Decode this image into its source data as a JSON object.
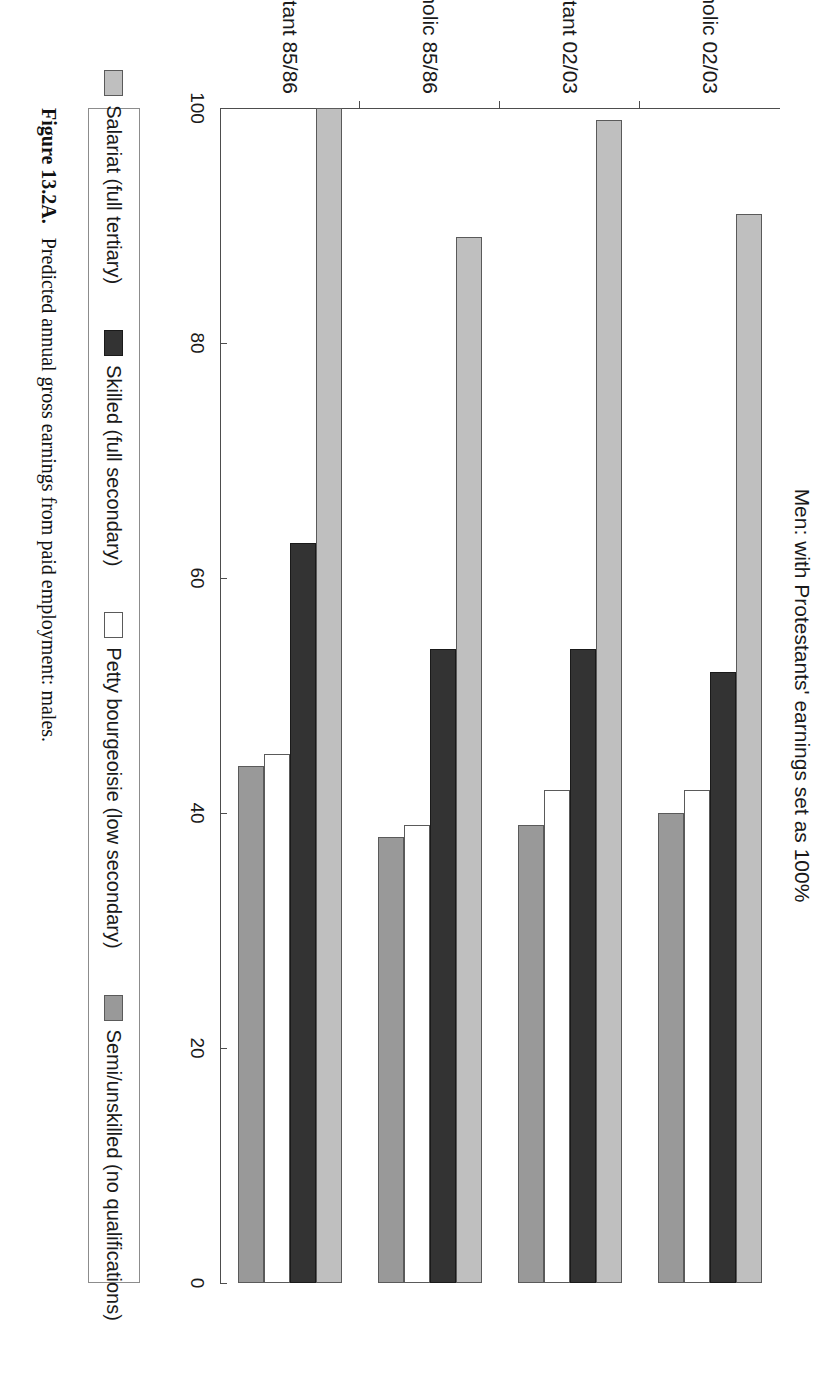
{
  "figure": {
    "caption_label": "Figure 13.2A.",
    "caption_text": "Predicted annual gross earnings from paid employment: males."
  },
  "chart_data": {
    "type": "bar",
    "orientation": "horizontal",
    "title": "Men: with Protestants' earnings set as 100%",
    "xlabel": "",
    "ylabel": "",
    "ylim": [
      0,
      100
    ],
    "xlim": [
      0,
      100
    ],
    "grid": false,
    "legend_position": "bottom",
    "ticks": [
      "100",
      "80",
      "60",
      "40",
      "20",
      "0"
    ],
    "tick_values": [
      100,
      80,
      60,
      40,
      20,
      0
    ],
    "categories": [
      "Protestant 85/86",
      "Catholic 85/86",
      "Protestant 02/03",
      "Catholic 02/03"
    ],
    "series": [
      {
        "name": "Salariat (full tertiary)",
        "color": "#bfbfbf",
        "values": [
          100,
          89,
          99,
          91
        ]
      },
      {
        "name": "Skilled (full secondary)",
        "color": "#333333",
        "values": [
          63,
          54,
          54,
          52
        ]
      },
      {
        "name": "Petty bourgeoisie (low secondary)",
        "color": "#ffffff",
        "values": [
          45,
          39,
          42,
          42
        ]
      },
      {
        "name": "Semi/unskilled (no qualifications)",
        "color": "#999999",
        "values": [
          44,
          38,
          39,
          40
        ]
      }
    ]
  }
}
